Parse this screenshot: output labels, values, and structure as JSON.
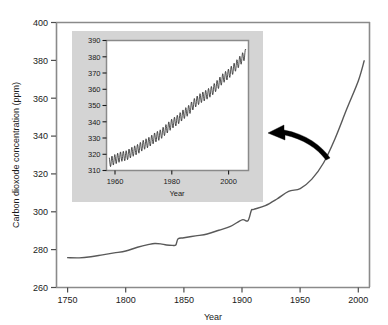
{
  "chart_data": {
    "type": "line",
    "title": "",
    "xlabel": "Year",
    "ylabel": "Carbon dioxode concentration (ppm)",
    "xlim": [
      1740,
      2010
    ],
    "ylim": [
      260,
      400
    ],
    "xticks": [
      1750,
      1800,
      1850,
      1900,
      1950,
      2000
    ],
    "yticks": [
      260,
      280,
      300,
      320,
      340,
      360,
      380,
      400
    ],
    "grid": false,
    "legend": null,
    "line_color": "#4d4d4d",
    "series": [
      {
        "name": "Atmospheric CO2 (ice core + instrumental)",
        "x": [
          1750,
          1760,
          1770,
          1780,
          1790,
          1800,
          1810,
          1820,
          1825,
          1830,
          1835,
          1840,
          1843,
          1845,
          1850,
          1860,
          1870,
          1880,
          1890,
          1900,
          1905,
          1908,
          1910,
          1920,
          1930,
          1940,
          1950,
          1960,
          1970,
          1980,
          1990,
          2000,
          2005
        ],
        "y": [
          275.5,
          275.4,
          276.0,
          277.0,
          278.0,
          279.0,
          281.0,
          282.5,
          283.0,
          282.8,
          282.2,
          282.0,
          282.2,
          285.5,
          286.0,
          287.0,
          288.0,
          290.0,
          292.0,
          295.5,
          295.0,
          300.5,
          301.0,
          303.0,
          306.5,
          310.5,
          312.0,
          317.0,
          325.5,
          338.5,
          354.0,
          369.0,
          379.5
        ]
      }
    ],
    "inset": {
      "type": "line",
      "title": "",
      "xlabel": "Year",
      "ylabel": "",
      "xlim": [
        1957,
        2007
      ],
      "ylim": [
        310,
        390
      ],
      "xticks": [
        1960,
        1980,
        2000
      ],
      "yticks": [
        310,
        320,
        330,
        340,
        350,
        360,
        370,
        380,
        390
      ],
      "grid": false,
      "background": "#d4d4d4",
      "plot_background": "#ffffff",
      "line_color": "#1a1a1a",
      "description": "Keeling curve: monthly mean CO2 with seasonal sawtooth oscillation",
      "seasonal_amplitude_ppm": 3,
      "series": [
        {
          "name": "Mauna Loa monthly mean CO2",
          "x": [
            1958,
            1960,
            1962,
            1964,
            1966,
            1968,
            1970,
            1972,
            1974,
            1976,
            1978,
            1980,
            1982,
            1984,
            1986,
            1988,
            1990,
            1992,
            1994,
            1996,
            1998,
            2000,
            2002,
            2004,
            2006
          ],
          "y": [
            315.0,
            316.9,
            318.5,
            319.2,
            321.4,
            323.1,
            325.7,
            327.5,
            330.2,
            332.1,
            335.4,
            338.7,
            341.1,
            344.4,
            347.2,
            351.5,
            354.4,
            356.4,
            358.8,
            362.6,
            366.7,
            369.5,
            373.2,
            377.5,
            381.8
          ]
        }
      ]
    },
    "annotations": [
      {
        "name": "callout-arrow",
        "type": "curved-arrow",
        "points_from": "main-curve-near-1990",
        "points_to": "inset-panel",
        "color": "#000000"
      }
    ]
  }
}
